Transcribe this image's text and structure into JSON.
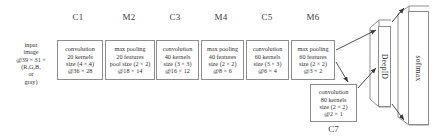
{
  "figure": {
    "type": "cnn-architecture-diagram",
    "title": "",
    "colors": {
      "stroke": "#8d8d8d",
      "text": "#333333",
      "background": "#ffffff",
      "arrow": "#3a3a3a"
    }
  },
  "input": {
    "name": "input-image",
    "lines": [
      "input",
      "image",
      "@39 × 31 ×",
      "(R,G,B,",
      "or",
      "gray)"
    ]
  },
  "stages": [
    {
      "id": "C1",
      "label": "C1",
      "kind": "convolution",
      "lines": [
        "convolution",
        "20 kernels",
        "size (4 × 4)",
        "@36 × 28"
      ]
    },
    {
      "id": "M2",
      "label": "M2",
      "kind": "max-pooling",
      "lines": [
        "max pooling",
        "20 features",
        "pool size (2 × 2)",
        "@18 × 14"
      ]
    },
    {
      "id": "C3",
      "label": "C3",
      "kind": "convolution",
      "lines": [
        "convolution",
        "40 kernels",
        "size (3 × 3)",
        "@16 × 12"
      ]
    },
    {
      "id": "M4",
      "label": "M4",
      "kind": "max-pooling",
      "lines": [
        "max pooling",
        "40 features",
        "size (2 × 2)",
        "@8 × 6"
      ]
    },
    {
      "id": "C5",
      "label": "C5",
      "kind": "convolution",
      "lines": [
        "convolution",
        "60 kernels",
        "size (3 × 3)",
        "@6 × 4"
      ]
    },
    {
      "id": "M6",
      "label": "M6",
      "kind": "max-pooling",
      "lines": [
        "max pooling",
        "60 features",
        "size (2 × 2)",
        "@3 × 2"
      ]
    },
    {
      "id": "C7",
      "label": "C7",
      "kind": "convolution",
      "lines": [
        "convolution",
        "80 kernels",
        "size (2 × 2)",
        "@2 × 1"
      ]
    }
  ],
  "outputs": [
    {
      "id": "DeepID",
      "label": "DeepID"
    },
    {
      "id": "softmax",
      "label": "softmax"
    }
  ]
}
